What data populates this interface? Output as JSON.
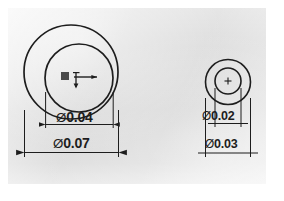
{
  "document": {
    "type": "engineering-drawing",
    "title": "Concentric circle hole dimension drawing",
    "background_color": "#d8d8d8",
    "line_color": "#1d1d1d"
  },
  "figures": [
    {
      "id": "left-figure",
      "name": "large-concentric-circles",
      "center_marker": "origin-axes-marker",
      "dimensions": [
        {
          "name": "inner-diameter",
          "symbol": "Ø",
          "value": "0.04",
          "label": "Ø0.04"
        },
        {
          "name": "outer-diameter",
          "symbol": "Ø",
          "value": "0.07",
          "label": "Ø0.07"
        }
      ]
    },
    {
      "id": "right-figure",
      "name": "small-concentric-circles",
      "center_marker": "center-cross-mark",
      "dimensions": [
        {
          "name": "inner-diameter",
          "symbol": "Ø",
          "value": "0.02",
          "label": "Ø0.02"
        },
        {
          "name": "outer-diameter",
          "symbol": "Ø",
          "value": "0.03",
          "label": "Ø0.03"
        }
      ]
    }
  ],
  "labels": {
    "left_inner_symbol": "Ø",
    "left_inner_value": "0.04",
    "left_outer_symbol": "Ø",
    "left_outer_value": "0.07",
    "right_inner_symbol": "Ø",
    "right_inner_value": "0.02",
    "right_outer_symbol": "Ø",
    "right_outer_value": "0.03"
  }
}
